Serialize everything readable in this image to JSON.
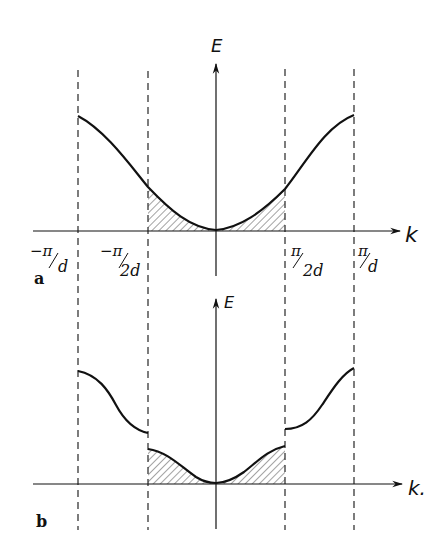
{
  "figure": {
    "panel_a": {
      "label": "a",
      "y_axis_label": "E",
      "x_axis_label": "k",
      "ticks": [
        {
          "num": "−π",
          "den": "d"
        },
        {
          "num": "−π",
          "den": "2d"
        },
        {
          "num": "π",
          "den": "2d"
        },
        {
          "num": "π",
          "den": "d"
        }
      ],
      "description": "Single continuous cosine-like band E(k) over the first Brillouin zone (-π/d to π/d); occupied states between -π/2d and π/2d shaded with hatching."
    },
    "panel_b": {
      "label": "b",
      "y_axis_label": "E",
      "x_axis_label": "k.",
      "description": "Band split by gaps at ±π/2d: lower band (shaded, fully occupied) between -π/2d and π/2d, upper band segments beyond."
    },
    "colors": {
      "line": "#111111",
      "hatch": "#333333",
      "background": "#ffffff"
    }
  }
}
